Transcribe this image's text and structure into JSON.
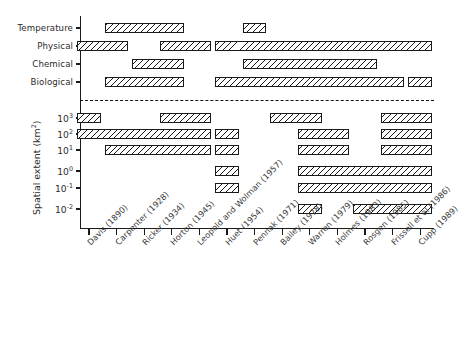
{
  "chart_data": {
    "type": "bar",
    "title": "",
    "xlabel": "",
    "ylabel": "Spatial extent (km²)",
    "grid": false,
    "legend": null,
    "orientation": "horizontal-ranges",
    "categories": [
      "Davis (1890)",
      "Carpenter (1928)",
      "Ricker (1934)",
      "Horton (1945)",
      "Leopold and Wolman (1957)",
      "Huet (1954)",
      "Pennak (1971)",
      "Bailey (1978)",
      "Warren (1979)",
      "Holmes (1983)",
      "Rosgen (1985)",
      "Frissell et al (1986)",
      "Cupp (1989)"
    ],
    "upper_panel": {
      "rows": [
        "Temperature",
        "Physical",
        "Chemical",
        "Biological"
      ],
      "bars": [
        {
          "row": "Temperature",
          "start_col": 1,
          "end_col": 3
        },
        {
          "row": "Temperature",
          "start_col": 6,
          "end_col": 6
        },
        {
          "row": "Physical",
          "start_col": 0,
          "end_col": 1
        },
        {
          "row": "Physical",
          "start_col": 3,
          "end_col": 4
        },
        {
          "row": "Physical",
          "start_col": 5,
          "end_col": 12
        },
        {
          "row": "Chemical",
          "start_col": 2,
          "end_col": 3
        },
        {
          "row": "Chemical",
          "start_col": 6,
          "end_col": 10
        },
        {
          "row": "Biological",
          "start_col": 1,
          "end_col": 3
        },
        {
          "row": "Biological",
          "start_col": 5,
          "end_col": 11
        },
        {
          "row": "Biological",
          "start_col": 12,
          "end_col": 12
        }
      ]
    },
    "lower_panel": {
      "yticks": [
        "10³",
        "10²",
        "10¹",
        "10⁰",
        "10⁻¹",
        "10⁻²"
      ],
      "ytick_exponents": [
        3,
        2,
        1,
        0,
        -1,
        -2
      ],
      "bars": [
        {
          "row": 0,
          "start_col": 0,
          "end_col": 0
        },
        {
          "row": 0,
          "start_col": 3,
          "end_col": 4
        },
        {
          "row": 0,
          "start_col": 7,
          "end_col": 8
        },
        {
          "row": 0,
          "start_col": 11,
          "end_col": 12
        },
        {
          "row": 1,
          "start_col": 0,
          "end_col": 4
        },
        {
          "row": 1,
          "start_col": 5,
          "end_col": 5
        },
        {
          "row": 1,
          "start_col": 8,
          "end_col": 9
        },
        {
          "row": 1,
          "start_col": 11,
          "end_col": 12
        },
        {
          "row": 2,
          "start_col": 1,
          "end_col": 4
        },
        {
          "row": 2,
          "start_col": 5,
          "end_col": 5
        },
        {
          "row": 2,
          "start_col": 8,
          "end_col": 9
        },
        {
          "row": 2,
          "start_col": 11,
          "end_col": 12
        },
        {
          "row": 3,
          "start_col": 9,
          "end_col": 9
        },
        {
          "row": 3,
          "start_col": 5,
          "end_col": 5
        },
        {
          "row": 3,
          "start_col": 8,
          "end_col": 12
        },
        {
          "row": 4,
          "start_col": 9,
          "end_col": 9
        },
        {
          "row": 4,
          "start_col": 5,
          "end_col": 5
        },
        {
          "row": 4,
          "start_col": 8,
          "end_col": 12
        },
        {
          "row": 5,
          "start_col": 8,
          "end_col": 8
        },
        {
          "row": 5,
          "start_col": 10,
          "end_col": 12
        }
      ]
    }
  }
}
